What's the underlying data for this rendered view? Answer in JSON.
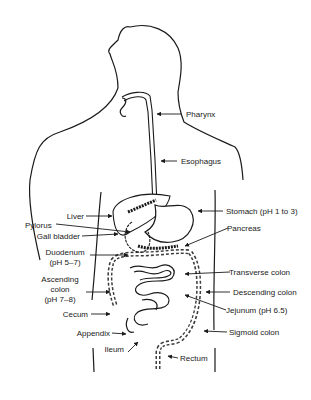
{
  "diagram": {
    "labels": {
      "pharynx": "Pharynx",
      "esophagus": "Esophagus",
      "liver": "Liver",
      "pylorus": "Pylorus",
      "gall_bladder": "Gall bladder",
      "duodenum_1": "Duodenum",
      "duodenum_2": "(pH 5–7)",
      "ascending_1": "Ascending",
      "ascending_2": "colon",
      "ascending_3": "(pH 7–8)",
      "cecum": "Cecum",
      "appendix": "Appendix",
      "ileum": "Ileum",
      "stomach": "Stomach (pH 1 to 3)",
      "pancreas": "Pancreas",
      "transverse": "Transverse colon",
      "descending": "Descending colon",
      "jejunum": "Jejunum (pH 6.5)",
      "sigmoid": "Sigmoid colon",
      "rectum": "Rectum"
    }
  }
}
